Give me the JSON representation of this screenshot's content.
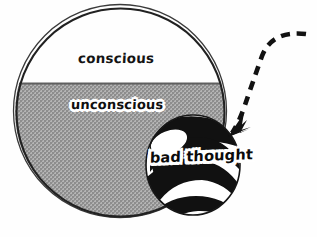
{
  "figure": {
    "title": "",
    "background_color": "#fefefe"
  },
  "mind_circle": {
    "name": "mind-circle",
    "outline_color": "#2b2b2b",
    "conscious": {
      "label": "conscious",
      "fill_color": "#ffffff",
      "text_color": "#141414"
    },
    "unconscious": {
      "label": "unconscious",
      "fill_color": "#a3a3a3",
      "texture": "stipple-halftone",
      "text_color": "#101010",
      "halo_color": "#ffffff"
    },
    "divider": {
      "name": "waterline-divider",
      "color": "#5a5a5a"
    }
  },
  "thought_ball": {
    "label": "bad thought",
    "name": "bad-thought-ball",
    "band_dark_color": "#111111",
    "band_light_color": "#ffffff",
    "outline_color": "#1a1a1a",
    "text_color": "#0b0b0b",
    "halo_color": "#ffffff"
  },
  "arrow": {
    "name": "dashed-incoming-arrow",
    "style": "dashed-curved",
    "color": "#111111",
    "points_to": "bad thought"
  },
  "icons": {
    "arrowhead": "arrowhead-icon",
    "circle": "circle-icon",
    "sphere": "sphere-icon"
  }
}
